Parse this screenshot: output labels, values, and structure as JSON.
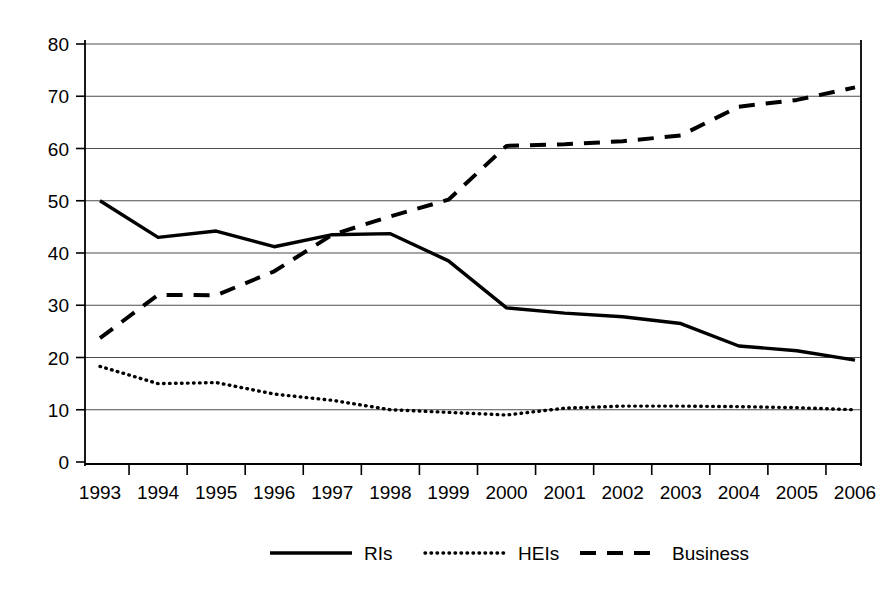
{
  "chart_data": {
    "type": "line",
    "title": "",
    "xlabel": "",
    "ylabel": "",
    "categories": [
      "1993",
      "1994",
      "1995",
      "1996",
      "1997",
      "1998",
      "1999",
      "2000",
      "2001",
      "2002",
      "2003",
      "2004",
      "2005",
      "2006"
    ],
    "ylim": [
      0,
      80
    ],
    "yticks": [
      0,
      10,
      20,
      30,
      40,
      50,
      60,
      70,
      80
    ],
    "grid": true,
    "legend_position": "bottom",
    "series": [
      {
        "name": "RIs",
        "style": "solid",
        "values": [
          50.0,
          43.0,
          44.2,
          41.2,
          43.5,
          43.7,
          38.5,
          29.5,
          28.5,
          27.8,
          26.5,
          22.2,
          21.3,
          19.5
        ]
      },
      {
        "name": "HEIs",
        "style": "dotted",
        "values": [
          18.3,
          15.0,
          15.2,
          13.0,
          11.8,
          10.0,
          9.5,
          9.0,
          10.3,
          10.7,
          10.7,
          10.6,
          10.4,
          10.0
        ]
      },
      {
        "name": "Business",
        "style": "dashed",
        "values": [
          23.7,
          32.0,
          31.9,
          36.5,
          43.5,
          47.0,
          50.2,
          60.5,
          60.8,
          61.4,
          62.5,
          68.0,
          69.3,
          71.7
        ]
      }
    ]
  },
  "axes": {
    "y_tick_labels": [
      "80",
      "70",
      "60",
      "50",
      "40",
      "30",
      "20",
      "10",
      "0"
    ],
    "x_tick_labels": [
      "1993",
      "1994",
      "1995",
      "1996",
      "1997",
      "1998",
      "1999",
      "2000",
      "2001",
      "2002",
      "2003",
      "2004",
      "2005",
      "2006"
    ]
  },
  "legend": {
    "items": [
      {
        "label": "RIs",
        "style": "solid"
      },
      {
        "label": "HEIs",
        "style": "dotted"
      },
      {
        "label": "Business",
        "style": "dashed"
      }
    ]
  },
  "colors": {
    "line": "#000000",
    "grid": "#4d4d4d",
    "background": "#ffffff"
  }
}
